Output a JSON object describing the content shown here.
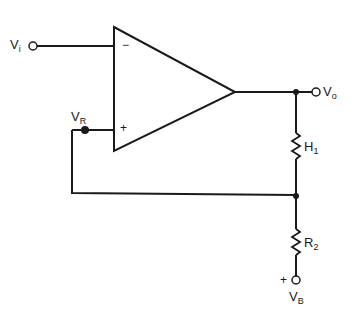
{
  "diagram": {
    "type": "circuit-schematic",
    "component": "op-amp comparator with hysteresis",
    "labels": {
      "vi": {
        "main": "V",
        "sub": "i"
      },
      "vr": {
        "main": "V",
        "sub": "R"
      },
      "vo": {
        "main": "V",
        "sub": "o"
      },
      "h1": {
        "main": "H",
        "sub": "1"
      },
      "r2": {
        "main": "R",
        "sub": "2"
      },
      "vb": {
        "main": "V",
        "sub": "B"
      }
    },
    "opamp": {
      "inverting_symbol": "−",
      "noninverting_symbol": "+"
    },
    "vb_polarity": "+",
    "colors": {
      "line": "#1a1a1a",
      "background": "#ffffff"
    }
  }
}
